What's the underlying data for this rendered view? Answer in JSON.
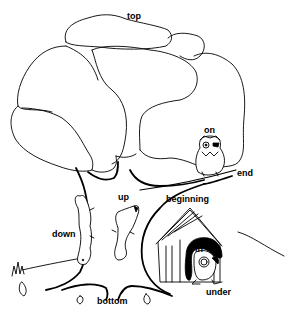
{
  "illustration": {
    "subject": "Positional words illustrated with a tree, animals and a doghouse",
    "labels": {
      "top": "top",
      "on": "on",
      "end": "end",
      "beginning": "beginning",
      "up": "up",
      "down": "down",
      "in": "in",
      "under": "under",
      "bottom": "bottom"
    },
    "elements": [
      "tree-crown",
      "tree-trunk",
      "branch",
      "owl",
      "squirrel-up",
      "squirrel-down",
      "doghouse",
      "dog",
      "grass-tuft",
      "leaves"
    ],
    "colors": {
      "line": "#000000",
      "background": "#ffffff"
    }
  }
}
